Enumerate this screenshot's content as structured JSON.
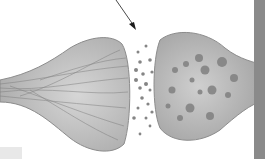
{
  "image": {
    "subject": "synapse illustration",
    "description": "Grayscale 3D rendering of a chemical synapse: presynaptic terminal (left, with filaments) releasing neurotransmitter vesicles across the synaptic cleft toward the postsynaptic terminal (right, with vesicles/organelles). An arrow points down into the synaptic cleft.",
    "colors": {
      "background": "#ffffff",
      "membrane": "#b8b8b8",
      "membrane_dark": "#8c8c8c",
      "fiber": "#7a7a7a",
      "vesicle": "#808080",
      "right_bar": "#8a8a8a",
      "arrow": "#1a1a1a"
    }
  }
}
